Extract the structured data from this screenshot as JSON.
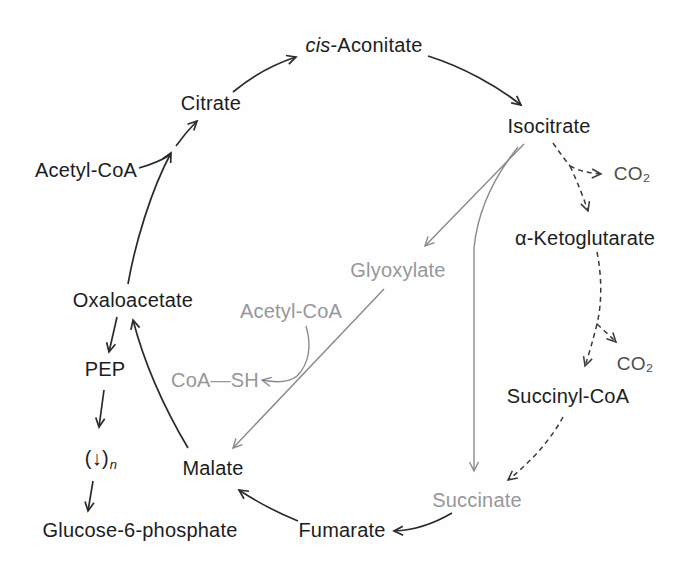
{
  "diagram": {
    "kind": "metabolic-pathway",
    "background": "#fefefe"
  },
  "colors": {
    "text_black": "#1d1d1d",
    "text_gray": "#97979b",
    "text_co2": "#4d4d4d",
    "line_black": "#2b2b2b",
    "line_gray": "#8a8a8e",
    "line_dashed": "#3a3a3a"
  },
  "nodes": {
    "cis_aconitate_italic": "cis",
    "cis_aconitate_rest": "-Aconitate",
    "citrate": "Citrate",
    "isocitrate": "Isocitrate",
    "acetyl_coa_top": "Acetyl-CoA",
    "co2_upper": "CO₂",
    "alpha_ketoglutarate": "α-Ketoglutarate",
    "glyoxylate": "Glyoxylate",
    "oxaloacetate": "Oxaloacetate",
    "acetyl_coa_mid": "Acetyl-CoA",
    "coa_sh": "CoA—SH",
    "pep": "PEP",
    "succinyl_coa": "Succinyl-CoA",
    "co2_lower": "CO₂",
    "poly_symbol": "(↓)",
    "poly_sub": "n",
    "malate": "Malate",
    "succinate": "Succinate",
    "glucose_6_phosphate": "Glucose-6-phosphate",
    "fumarate": "Fumarate"
  },
  "edges": [
    {
      "from": "Citrate",
      "to": "cis-Aconitate",
      "style": "solid",
      "color": "black"
    },
    {
      "from": "cis-Aconitate",
      "to": "Isocitrate",
      "style": "solid",
      "color": "black"
    },
    {
      "from": "Oxaloacetate",
      "to": "Citrate",
      "style": "solid",
      "color": "black"
    },
    {
      "from": "Acetyl-CoA",
      "to": "Citrate",
      "style": "solid-merge",
      "color": "black"
    },
    {
      "from": "Isocitrate",
      "to": "CO₂",
      "style": "dashed",
      "color": "dark"
    },
    {
      "from": "Isocitrate",
      "to": "α-Ketoglutarate",
      "style": "dashed",
      "color": "dark"
    },
    {
      "from": "α-Ketoglutarate",
      "to": "CO₂",
      "style": "dashed",
      "color": "dark"
    },
    {
      "from": "α-Ketoglutarate",
      "to": "Succinyl-CoA",
      "style": "dashed",
      "color": "dark"
    },
    {
      "from": "Succinyl-CoA",
      "to": "Succinate",
      "style": "dashed",
      "color": "dark"
    },
    {
      "from": "Isocitrate",
      "to": "Glyoxylate",
      "style": "solid",
      "color": "gray"
    },
    {
      "from": "Glyoxylate",
      "to": "Malate",
      "style": "solid",
      "color": "gray"
    },
    {
      "from": "Isocitrate",
      "to": "Succinate",
      "style": "solid",
      "color": "gray"
    },
    {
      "from": "Acetyl-CoA",
      "to": "CoA—SH",
      "style": "solid",
      "color": "gray"
    },
    {
      "from": "Succinate",
      "to": "Fumarate",
      "style": "solid",
      "color": "black"
    },
    {
      "from": "Fumarate",
      "to": "Malate",
      "style": "solid",
      "color": "black"
    },
    {
      "from": "Malate",
      "to": "Oxaloacetate",
      "style": "solid",
      "color": "black"
    },
    {
      "from": "Oxaloacetate",
      "to": "PEP",
      "style": "solid",
      "color": "black"
    },
    {
      "from": "PEP",
      "to": "(↓)n",
      "style": "solid",
      "color": "black"
    },
    {
      "from": "(↓)n",
      "to": "Glucose-6-phosphate",
      "style": "solid",
      "color": "black"
    }
  ]
}
